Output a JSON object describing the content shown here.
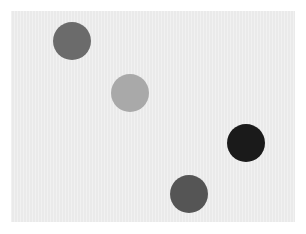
{
  "canvas": {
    "width": 306,
    "height": 234,
    "background": "#ffffff"
  },
  "panel": {
    "x": 11,
    "y": 11,
    "width": 284,
    "height": 211,
    "color": "#eaeaea"
  },
  "circles": [
    {
      "id": "circle-1",
      "cx": 72,
      "cy": 41,
      "r": 19,
      "color": "#6b6b6b"
    },
    {
      "id": "circle-2",
      "cx": 130,
      "cy": 93,
      "r": 19,
      "color": "#a9a9a9"
    },
    {
      "id": "circle-3",
      "cx": 246,
      "cy": 143,
      "r": 19,
      "color": "#1a1a1a"
    },
    {
      "id": "circle-4",
      "cx": 189,
      "cy": 194,
      "r": 19,
      "color": "#555555"
    }
  ]
}
